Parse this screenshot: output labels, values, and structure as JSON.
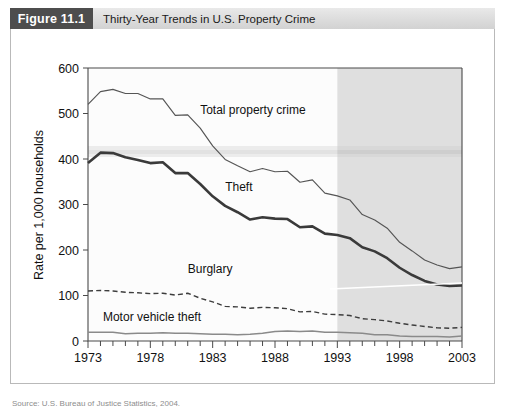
{
  "header": {
    "figure_number": "Figure 11.1",
    "title": "Thirty-Year Trends in U.S. Property Crime"
  },
  "chart_data": {
    "type": "line",
    "title": "Thirty-Year Trends in U.S. Property Crime",
    "xlabel": "",
    "ylabel": "Rate per 1,000 households",
    "xlim": [
      1973,
      2003
    ],
    "ylim": [
      0,
      600
    ],
    "ytick_labels": [
      "0",
      "100",
      "200",
      "300",
      "400",
      "500",
      "600"
    ],
    "ytick_values": [
      0,
      100,
      200,
      300,
      400,
      500,
      600
    ],
    "xtick_labels": [
      "1973",
      "1978",
      "1983",
      "1988",
      "1993",
      "1998",
      "2003"
    ],
    "xtick_values": [
      1973,
      1978,
      1983,
      1988,
      1993,
      1998,
      2003
    ],
    "minor_xticks_every": 1,
    "grid": false,
    "legend_position": "inline-annotations",
    "shaded_region": {
      "from": 1993,
      "to": 2003,
      "color": "#d6d6d6",
      "note": "gray shaded band covering 1993-2003"
    },
    "x": [
      1973,
      1974,
      1975,
      1976,
      1977,
      1978,
      1979,
      1980,
      1981,
      1982,
      1983,
      1984,
      1985,
      1986,
      1987,
      1988,
      1989,
      1990,
      1991,
      1992,
      1993,
      1994,
      1995,
      1996,
      1997,
      1998,
      1999,
      2000,
      2001,
      2002,
      2003
    ],
    "series": [
      {
        "name": "Total property crime",
        "style": "thin-solid",
        "color": "#555555",
        "values": [
          520,
          548,
          553,
          544,
          544,
          532,
          532,
          496,
          497,
          468,
          429,
          399,
          385,
          372,
          379,
          372,
          373,
          349,
          354,
          325,
          319,
          310,
          278,
          266,
          248,
          217,
          198,
          178,
          167,
          159,
          163
        ]
      },
      {
        "name": "Theft",
        "style": "thick-solid",
        "color": "#3a3a3a",
        "values": [
          391,
          414,
          413,
          404,
          398,
          391,
          393,
          369,
          369,
          345,
          318,
          297,
          283,
          267,
          272,
          269,
          268,
          250,
          252,
          236,
          233,
          226,
          206,
          197,
          182,
          161,
          145,
          132,
          124,
          121,
          122
        ]
      },
      {
        "name": "Burglary",
        "style": "dashed",
        "color": "#3d3d3d",
        "values": [
          110,
          111,
          110,
          107,
          106,
          104,
          105,
          101,
          105,
          94,
          86,
          76,
          75,
          72,
          74,
          73,
          71,
          64,
          65,
          59,
          58,
          56,
          49,
          47,
          44,
          39,
          35,
          32,
          29,
          28,
          30
        ]
      },
      {
        "name": "Motor vehicle theft",
        "style": "thin-solid-gray",
        "color": "#8a8a8a",
        "values": [
          19,
          19,
          19,
          16,
          17,
          17,
          18,
          17,
          17,
          16,
          15,
          15,
          14,
          15,
          17,
          21,
          22,
          21,
          22,
          19,
          19,
          18,
          17,
          14,
          14,
          11,
          10,
          10,
          10,
          9,
          11
        ]
      }
    ],
    "annotations": [
      {
        "text": "Total property crime",
        "x": 1982,
        "y": 500
      },
      {
        "text": "Theft",
        "x": 1984,
        "y": 330
      },
      {
        "text": "Burglary",
        "x": 1981,
        "y": 150
      },
      {
        "text": "Motor vehicle theft",
        "x": 1974.2,
        "y": 45
      }
    ]
  },
  "source": {
    "text": "Source: U.S. Bureau of Justice Statistics, 2004."
  }
}
